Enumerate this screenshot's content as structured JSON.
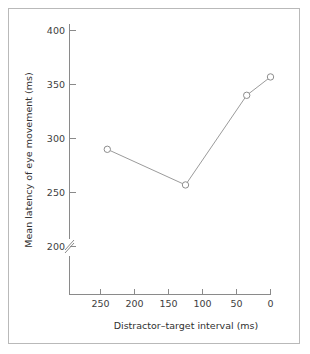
{
  "chart_data": {
    "type": "line",
    "title": "",
    "xlabel": "Distractor–target interval (ms)",
    "ylabel": "Mean latency of eye movement (ms)",
    "x": [
      240,
      125,
      35,
      0
    ],
    "values": [
      290,
      257,
      340,
      357
    ],
    "series": [
      {
        "name": "Mean latency of eye movement",
        "x": [
          240,
          125,
          35,
          0
        ],
        "values": [
          290,
          257,
          340,
          357
        ]
      }
    ],
    "xticks": [
      250,
      200,
      150,
      100,
      50,
      0
    ],
    "xtick_labels": [
      "250",
      "200",
      "150",
      "100",
      "50",
      "0"
    ],
    "yticks": [
      200,
      250,
      300,
      350,
      400
    ],
    "ytick_labels": [
      "200",
      "250",
      "300",
      "350",
      "400"
    ],
    "xlim": [
      270,
      -8
    ],
    "ylim": [
      185,
      405
    ],
    "x_axis_inverted": true,
    "y_axis_break": true,
    "y_axis_break_value": 190,
    "grid": false,
    "legend": false,
    "legend_position": "none",
    "marker": "open-circle",
    "colors": {
      "line": "#9b9b9b",
      "marker_fill": "#ffffff",
      "marker_stroke": "#8d8d8d",
      "axis": "#8a8a8a",
      "text": "#404040",
      "frame": "#b9b9b9",
      "background": "#ffffff"
    }
  }
}
